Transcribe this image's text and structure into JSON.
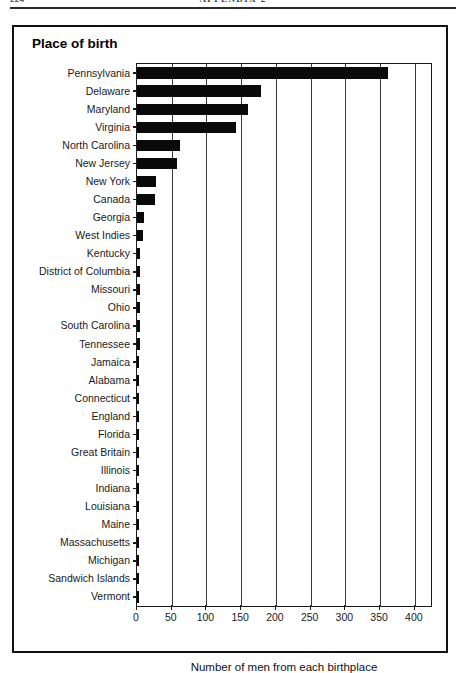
{
  "page": {
    "folio": "224",
    "running_head": "APPENDIX 2"
  },
  "figure": {
    "title": "Place of birth"
  },
  "chart_data": {
    "type": "bar",
    "orientation": "horizontal",
    "title": "Place of birth",
    "xlabel": "Number of men from each birthplace",
    "ylabel": "",
    "xlim": [
      0,
      400
    ],
    "xticks": [
      0,
      50,
      100,
      150,
      200,
      250,
      300,
      350,
      400
    ],
    "xticklabels": [
      "0",
      "50",
      "100",
      "150",
      "200",
      "250",
      "300",
      "350",
      "400"
    ],
    "grid": true,
    "grid_axis": "x",
    "legend": false,
    "bar_color": "#0a0a0a",
    "categories": [
      "Pennsylvania",
      "Delaware",
      "Maryland",
      "Virginia",
      "North Carolina",
      "New Jersey",
      "New York",
      "Canada",
      "Georgia",
      "West Indies",
      "Kentucky",
      "District of Columbia",
      "Missouri",
      "Ohio",
      "South Carolina",
      "Tennessee",
      "Jamaica",
      "Alabama",
      "Connecticut",
      "England",
      "Florida",
      "Great Britain",
      "Illinois",
      "Indiana",
      "Louisiana",
      "Maine",
      "Massachusetts",
      "Michigan",
      "Sandwich Islands",
      "Vermont"
    ],
    "values": [
      362,
      178,
      160,
      142,
      62,
      57,
      28,
      26,
      10,
      8,
      5,
      4,
      4,
      4,
      4,
      4,
      3,
      3,
      2,
      2,
      2,
      2,
      2,
      2,
      2,
      2,
      2,
      2,
      2,
      2
    ]
  }
}
